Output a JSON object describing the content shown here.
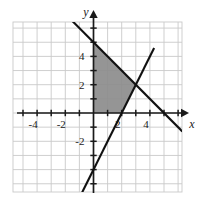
{
  "figure": {
    "kind": "coordinate-plane-graph",
    "background_color": "#ffffff"
  },
  "axes": {
    "x_axis_label": "x",
    "y_axis_label": "y",
    "axis_color": "#1a1a1a",
    "grid_color": "#c9c9c9",
    "x_tick_labels": [
      "-4",
      "-2",
      "2",
      "4"
    ],
    "y_tick_labels": [
      "4",
      "2",
      "-2"
    ],
    "x_range": [
      -5.7,
      6.3
    ],
    "y_range": [
      -5.6,
      6.5
    ],
    "grid": "on",
    "grid_step": 1,
    "labeled_step": 2
  },
  "chart_data": {
    "type": "line",
    "title": "",
    "xlabel": "x",
    "ylabel": "y",
    "xlim": [
      -5.7,
      6.3
    ],
    "ylim": [
      -5.6,
      6.5
    ],
    "grid": true,
    "legend": "none",
    "series": [
      {
        "name": "descending-line",
        "equation": "y = -x + 5",
        "slope": -1,
        "intercept": 5,
        "color": "#111111",
        "x": [
          -1.8,
          6.3
        ],
        "y": [
          6.8,
          -1.3
        ],
        "x_intercept": 5,
        "y_intercept": 5
      },
      {
        "name": "ascending-line",
        "equation": "y = 2x - 4",
        "slope": 2,
        "intercept": -4,
        "color": "#111111",
        "x": [
          -1.45,
          4.3
        ],
        "y": [
          -6.9,
          4.6
        ],
        "x_intercept": 2,
        "y_intercept": -4
      }
    ],
    "intersection_point": [
      3,
      2
    ],
    "shaded_region": {
      "name": "feasible-region",
      "fill_color": "#8c8c8c",
      "vertices": [
        [
          0,
          0
        ],
        [
          0,
          5
        ],
        [
          3,
          2
        ],
        [
          2,
          0
        ]
      ],
      "description": "quadrilateral bounded by the y-axis, the x-axis, y = -x + 5 and y = 2x - 4"
    }
  }
}
